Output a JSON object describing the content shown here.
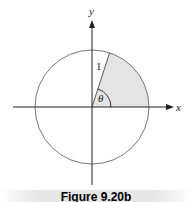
{
  "figure": {
    "axis_x_label": "x",
    "axis_y_label": "y",
    "radius_label": "1",
    "angle_label": "θ",
    "caption": "Figure 9.20b",
    "sector_color": "#e4e4e4",
    "line_color": "#333333"
  }
}
